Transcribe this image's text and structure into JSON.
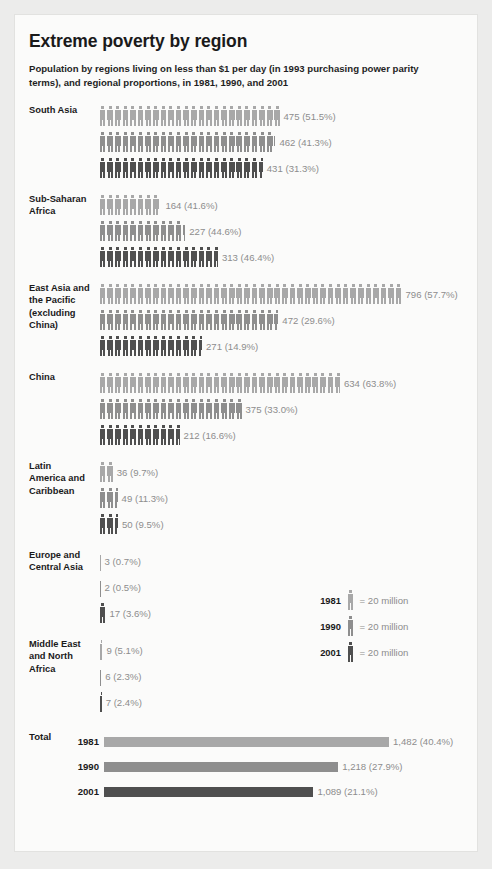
{
  "title": "Extreme poverty by region",
  "subtitle": "Population by regions living on less than $1 per day (in 1993 purchasing power parity terms), and regional proportions, in 1981, 1990, and 2001",
  "legend": {
    "unit_label": "= 20 million",
    "entries": [
      {
        "year": "1981",
        "text": "= 20 million"
      },
      {
        "year": "1990",
        "text": "= 20 million"
      },
      {
        "year": "2001",
        "text": "= 20 million"
      }
    ]
  },
  "total_section_label": "Total",
  "colors": {
    "year_1981": "#a8a8a8",
    "year_1990": "#8e8e8e",
    "year_2001": "#4f4f4f",
    "background": "#ececeb",
    "card": "#fbfbfa",
    "value_text": "#8d8d8d",
    "heading_text": "#1a1a1a"
  },
  "chart_data": {
    "type": "bar",
    "title": "Extreme poverty by region",
    "subtitle": "Population by regions living on less than $1 per day (in 1993 purchasing power parity terms), and regional proportions, in 1981, 1990, and 2001",
    "unit": "millions of people",
    "pictogram_unit_value": 20,
    "pictogram_unit_text": "= 20 million",
    "years": [
      "1981",
      "1990",
      "2001"
    ],
    "categories": [
      "South Asia",
      "Sub-Saharan Africa",
      "East Asia and the Pacific (excluding China)",
      "China",
      "Latin America and Caribbean",
      "Europe and Central Asia",
      "Middle East and North Africa"
    ],
    "series": [
      {
        "name": "1981",
        "values": [
          475,
          164,
          796,
          634,
          36,
          3,
          9
        ],
        "percents": [
          51.5,
          41.6,
          57.7,
          63.8,
          9.7,
          0.7,
          5.1
        ]
      },
      {
        "name": "1990",
        "values": [
          462,
          227,
          472,
          375,
          49,
          2,
          6
        ],
        "percents": [
          41.3,
          44.6,
          29.6,
          33.0,
          11.3,
          0.5,
          2.3
        ]
      },
      {
        "name": "2001",
        "values": [
          431,
          313,
          271,
          212,
          50,
          17,
          7
        ],
        "percents": [
          31.3,
          46.4,
          14.9,
          16.6,
          9.5,
          3.6,
          2.4
        ]
      }
    ],
    "totals": {
      "name": "Total",
      "values": [
        1482,
        1218,
        1089
      ],
      "percents": [
        40.4,
        27.9,
        21.1
      ]
    },
    "ylabel": "",
    "xlabel": "",
    "legend_position": "middle-right",
    "grid": false
  },
  "regions": [
    {
      "label": "South Asia",
      "label_lines": [
        "South Asia"
      ],
      "rows": [
        {
          "year": "1981",
          "value": 475,
          "percent": "51.5%",
          "value_label": "475 (51.5%)"
        },
        {
          "year": "1990",
          "value": 462,
          "percent": "41.3%",
          "value_label": "462 (41.3%)"
        },
        {
          "year": "2001",
          "value": 431,
          "percent": "31.3%",
          "value_label": "431 (31.3%)"
        }
      ]
    },
    {
      "label": "Sub-Saharan Africa",
      "label_lines": [
        "Sub-Saharan",
        "Africa"
      ],
      "rows": [
        {
          "year": "1981",
          "value": 164,
          "percent": "41.6%",
          "value_label": "164 (41.6%)"
        },
        {
          "year": "1990",
          "value": 227,
          "percent": "44.6%",
          "value_label": "227 (44.6%)"
        },
        {
          "year": "2001",
          "value": 313,
          "percent": "46.4%",
          "value_label": "313 (46.4%)"
        }
      ]
    },
    {
      "label": "East Asia and the Pacific (excluding China)",
      "label_lines": [
        "East Asia and",
        "the Pacific",
        "(excluding",
        "China)"
      ],
      "rows": [
        {
          "year": "1981",
          "value": 796,
          "percent": "57.7%",
          "value_label": "796 (57.7%)"
        },
        {
          "year": "1990",
          "value": 472,
          "percent": "29.6%",
          "value_label": "472 (29.6%)"
        },
        {
          "year": "2001",
          "value": 271,
          "percent": "14.9%",
          "value_label": "271 (14.9%)"
        }
      ]
    },
    {
      "label": "China",
      "label_lines": [
        "China"
      ],
      "rows": [
        {
          "year": "1981",
          "value": 634,
          "percent": "63.8%",
          "value_label": "634 (63.8%)"
        },
        {
          "year": "1990",
          "value": 375,
          "percent": "33.0%",
          "value_label": "375 (33.0%)"
        },
        {
          "year": "2001",
          "value": 212,
          "percent": "16.6%",
          "value_label": "212 (16.6%)"
        }
      ]
    },
    {
      "label": "Latin America and Caribbean",
      "label_lines": [
        "Latin",
        "America and",
        "Caribbean"
      ],
      "rows": [
        {
          "year": "1981",
          "value": 36,
          "percent": "9.7%",
          "value_label": "36 (9.7%)"
        },
        {
          "year": "1990",
          "value": 49,
          "percent": "11.3%",
          "value_label": "49 (11.3%)"
        },
        {
          "year": "2001",
          "value": 50,
          "percent": "9.5%",
          "value_label": "50 (9.5%)"
        }
      ]
    },
    {
      "label": "Europe and Central Asia",
      "label_lines": [
        "Europe and",
        "Central Asia"
      ],
      "rows": [
        {
          "year": "1981",
          "value": 3,
          "percent": "0.7%",
          "value_label": "3 (0.7%)"
        },
        {
          "year": "1990",
          "value": 2,
          "percent": "0.5%",
          "value_label": "2 (0.5%)"
        },
        {
          "year": "2001",
          "value": 17,
          "percent": "3.6%",
          "value_label": "17 (3.6%)"
        }
      ]
    },
    {
      "label": "Middle East and North Africa",
      "label_lines": [
        "Middle East",
        "and North",
        "Africa"
      ],
      "rows": [
        {
          "year": "1981",
          "value": 9,
          "percent": "5.1%",
          "value_label": "9 (5.1%)"
        },
        {
          "year": "1990",
          "value": 6,
          "percent": "2.3%",
          "value_label": "6 (2.3%)"
        },
        {
          "year": "2001",
          "value": 7,
          "percent": "2.4%",
          "value_label": "7 (2.4%)"
        }
      ]
    }
  ],
  "total": {
    "label": "Total",
    "rows": [
      {
        "year": "1981",
        "value": 1482,
        "percent": "40.4%",
        "value_label": "1,482 (40.4%)"
      },
      {
        "year": "1990",
        "value": 1218,
        "percent": "27.9%",
        "value_label": "1,218 (27.9%)"
      },
      {
        "year": "2001",
        "value": 1089,
        "percent": "21.1%",
        "value_label": "1,089 (21.1%)"
      }
    ]
  }
}
